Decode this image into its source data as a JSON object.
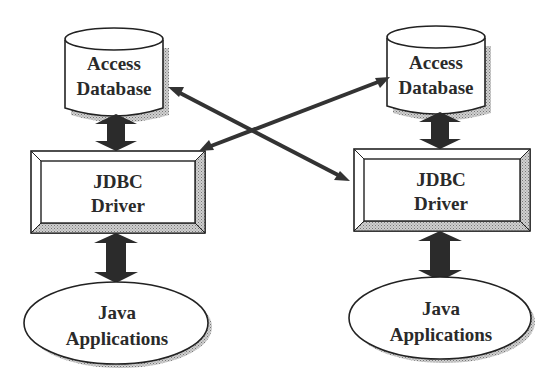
{
  "diagram": {
    "title": "",
    "colors": {
      "stroke": "#222222",
      "arrow": "#333333",
      "shadow": "#9a9a9a",
      "fill": "#ffffff"
    },
    "stacks": [
      {
        "id": "left",
        "database": {
          "line1": "Access",
          "line2": "Database",
          "shape": "cylinder"
        },
        "driver": {
          "line1": "JDBC",
          "line2": "Driver",
          "shape": "beveled-box"
        },
        "application": {
          "line1": "Java",
          "line2": "Applications",
          "shape": "ellipse"
        }
      },
      {
        "id": "right",
        "database": {
          "line1": "Access",
          "line2": "Database",
          "shape": "cylinder"
        },
        "driver": {
          "line1": "JDBC",
          "line2": "Driver",
          "shape": "beveled-box"
        },
        "application": {
          "line1": "Java",
          "line2": "Applications",
          "shape": "ellipse"
        }
      }
    ],
    "connections": [
      {
        "from": "left.database",
        "to": "left.driver",
        "type": "bidirectional-thick"
      },
      {
        "from": "left.driver",
        "to": "left.application",
        "type": "bidirectional-thick"
      },
      {
        "from": "right.database",
        "to": "right.driver",
        "type": "bidirectional-thick"
      },
      {
        "from": "right.driver",
        "to": "right.application",
        "type": "bidirectional-thick"
      },
      {
        "from": "left.database",
        "to": "right.driver",
        "type": "bidirectional-thin"
      },
      {
        "from": "right.database",
        "to": "left.driver",
        "type": "bidirectional-thin"
      }
    ]
  }
}
